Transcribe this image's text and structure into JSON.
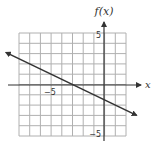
{
  "graph": {
    "y_axis_label": "f(x)",
    "x_axis_label": "x",
    "tick_labels": {
      "y_top": "5",
      "y_bottom": "−5",
      "x_left": "−5"
    },
    "colors": {
      "grid": "#b0b0b0",
      "axis": "#333333",
      "line": "#333333"
    }
  },
  "chart_data": {
    "type": "line",
    "title": "",
    "xlabel": "x",
    "ylabel": "f(x)",
    "xlim": [
      -8,
      2
    ],
    "ylim": [
      -5,
      5
    ],
    "grid": true,
    "grid_step": 1,
    "tick_labels": {
      "x": [
        "-5"
      ],
      "y": [
        "5",
        "-5"
      ]
    },
    "series": [
      {
        "name": "f(x)",
        "description": "straight line with arrows on both ends, decreasing",
        "slope": -0.5,
        "intercept": -1.5,
        "x": [
          -8.9,
          -8,
          -3,
          0,
          3
        ],
        "y": [
          2.7,
          2.5,
          0,
          -1.5,
          -3.0
        ]
      }
    ],
    "x_intercept": -3,
    "y_intercept": -1.5
  }
}
